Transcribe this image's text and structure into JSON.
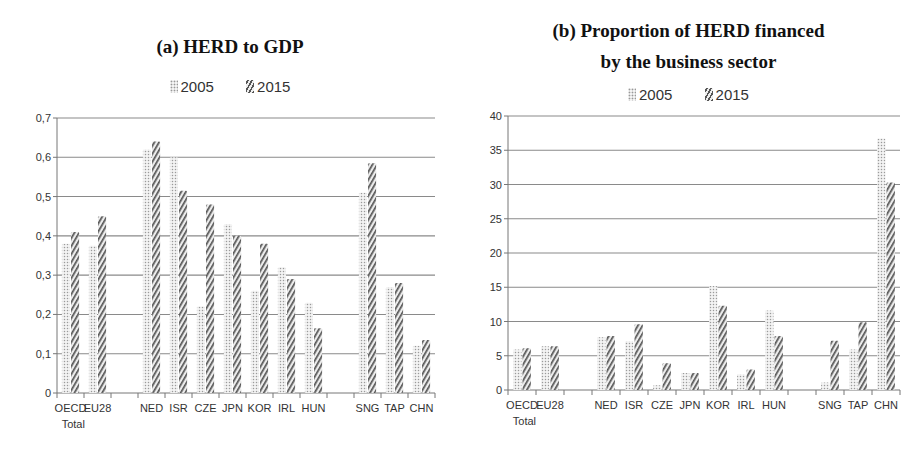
{
  "chart_data": [
    {
      "type": "bar",
      "title": "(a) HERD to GDP",
      "xlabel": "",
      "ylabel": "",
      "ylim": [
        0,
        0.7
      ],
      "yticks": [
        "0",
        "0,1",
        "0,2",
        "0,3",
        "0,4",
        "0,5",
        "0,6",
        "0,7"
      ],
      "grid": true,
      "legend_position": "top",
      "categories": [
        "OECD Total",
        "EU28",
        "",
        "NED",
        "ISR",
        "CZE",
        "JPN",
        "KOR",
        "IRL",
        "HUN",
        "",
        "SNG",
        "TAP",
        "CHN"
      ],
      "series": [
        {
          "name": "2005",
          "pattern": "dotted",
          "values": [
            0.38,
            0.375,
            null,
            0.62,
            0.6,
            0.22,
            0.43,
            0.26,
            0.32,
            0.23,
            null,
            0.51,
            0.27,
            0.12
          ]
        },
        {
          "name": "2015",
          "pattern": "hatched",
          "values": [
            0.41,
            0.45,
            null,
            0.64,
            0.515,
            0.48,
            0.4,
            0.38,
            0.29,
            0.165,
            null,
            0.585,
            0.28,
            0.135
          ]
        }
      ]
    },
    {
      "type": "bar",
      "title": "(b) Proportion of HERD financed by the business sector",
      "xlabel": "",
      "ylabel": "",
      "ylim": [
        0,
        40
      ],
      "yticks": [
        "0",
        "5",
        "10",
        "15",
        "20",
        "25",
        "30",
        "35",
        "40"
      ],
      "grid": true,
      "legend_position": "top",
      "categories": [
        "OECD Total",
        "EU28",
        "",
        "NED",
        "ISR",
        "CZE",
        "JPN",
        "KOR",
        "IRL",
        "HUN",
        "",
        "SNG",
        "TAP",
        "CHN"
      ],
      "series": [
        {
          "name": "2005",
          "pattern": "dotted",
          "values": [
            5.9,
            6.4,
            null,
            7.7,
            7.1,
            0.7,
            2.5,
            15.2,
            2.3,
            11.6,
            null,
            1.1,
            5.9,
            36.7
          ]
        },
        {
          "name": "2015",
          "pattern": "hatched",
          "values": [
            6.1,
            6.4,
            null,
            7.9,
            9.6,
            3.9,
            2.5,
            12.3,
            3.0,
            7.9,
            null,
            7.2,
            9.9,
            30.3
          ]
        }
      ]
    }
  ],
  "panel_a": {
    "title": "(a) HERD to GDP",
    "legend": [
      "2005",
      "2015"
    ]
  },
  "panel_b": {
    "title_line1": "(b) Proportion of HERD financed",
    "title_line2": "by the business sector",
    "legend": [
      "2005",
      "2015"
    ]
  },
  "colors": {
    "gridline": "#8a8a8a",
    "axis": "#777777",
    "bar_2005_dots": "#9a9a9a",
    "bar_2015_hatch": "#555555"
  }
}
